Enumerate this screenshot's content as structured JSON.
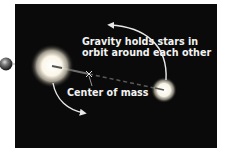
{
  "diagram": {
    "caption_line1": "Gravity holds stars in",
    "caption_line2": "orbit around each other",
    "center_label": "Center of mass",
    "center_marker": "×",
    "colors": {
      "background": "#0a0a0a",
      "page": "#ffffff",
      "text": "#f2f2f2",
      "star": "#ffffff",
      "arrow": "#e8e8e8"
    },
    "elements": {
      "large_star": {
        "cx": 52,
        "cy": 66
      },
      "small_star": {
        "cx": 164,
        "cy": 90
      },
      "center_of_mass": {
        "x": 89,
        "y": 74
      },
      "planet": {
        "cx": 6,
        "cy": 64
      }
    }
  }
}
